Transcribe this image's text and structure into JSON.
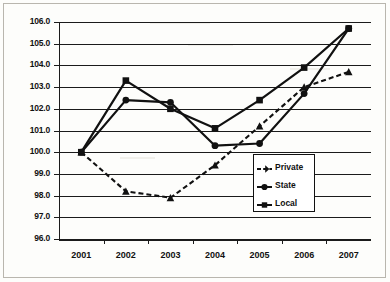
{
  "chart_data": {
    "type": "line",
    "title": "",
    "subtitle": "",
    "xlabel": "",
    "ylabel": "",
    "categories": [
      "2001",
      "2002",
      "2003",
      "2004",
      "2005",
      "2006",
      "2007"
    ],
    "x": [
      2001,
      2002,
      2003,
      2004,
      2005,
      2006,
      2007
    ],
    "ylim": [
      96.0,
      106.0
    ],
    "ytick_labels": [
      "96.0",
      "97.0",
      "98.0",
      "99.0",
      "100.0",
      "101.0",
      "102.0",
      "103.0",
      "104.0",
      "105.0",
      "106.0"
    ],
    "ytick_values": [
      96.0,
      97.0,
      98.0,
      99.0,
      100.0,
      101.0,
      102.0,
      103.0,
      104.0,
      105.0,
      106.0
    ],
    "grid": true,
    "grid_axis": "y",
    "legend_position": "inside-bottom-right",
    "series": [
      {
        "name": "Private",
        "values": [
          100.0,
          98.2,
          97.9,
          99.4,
          101.2,
          103.0,
          103.7
        ],
        "line_style": "dashed",
        "marker": "triangle",
        "color": "#111111"
      },
      {
        "name": "State",
        "values": [
          100.0,
          102.4,
          102.3,
          100.3,
          100.4,
          102.7,
          105.7
        ],
        "line_style": "solid",
        "marker": "circle",
        "color": "#111111"
      },
      {
        "name": "Local",
        "values": [
          100.0,
          103.3,
          102.0,
          101.1,
          102.4,
          103.9,
          105.7
        ],
        "line_style": "solid",
        "marker": "square",
        "color": "#111111"
      }
    ]
  },
  "legend": {
    "entries": [
      {
        "label": "Private"
      },
      {
        "label": "State"
      },
      {
        "label": "Local"
      }
    ]
  },
  "colors": {
    "ink": "#111111",
    "grid": "#1b1b1b",
    "background": "#fdfdfb",
    "frame": "#b9b6ae"
  }
}
